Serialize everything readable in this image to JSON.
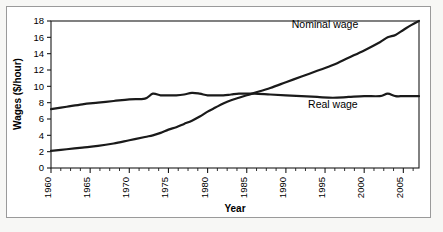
{
  "chart_data": {
    "type": "line",
    "title": "",
    "xlabel": "Year",
    "ylabel": "Wages ($/hour)",
    "xlim": [
      1960,
      2007
    ],
    "ylim": [
      0,
      18
    ],
    "ytick_step": 2,
    "xtick_step": 5,
    "minor_ticks": true,
    "grid": false,
    "legend_position": "inline-annotations",
    "ytick_labels": [
      "0",
      "2",
      "4",
      "6",
      "8",
      "10",
      "12",
      "14",
      "16",
      "18"
    ],
    "ytick_values": [
      0,
      2,
      4,
      6,
      8,
      10,
      12,
      14,
      16,
      18
    ],
    "xtick_labels": [
      "1960",
      "1965",
      "1970",
      "1975",
      "1980",
      "1985",
      "1990",
      "1995",
      "2000",
      "2005"
    ],
    "xtick_values": [
      1960,
      1965,
      1970,
      1975,
      1980,
      1985,
      1990,
      1995,
      2000,
      2005
    ],
    "x": [
      1960,
      1962,
      1964,
      1966,
      1968,
      1970,
      1972,
      1973,
      1974,
      1975,
      1976,
      1977,
      1978,
      1979,
      1980,
      1981,
      1982,
      1983,
      1984,
      1985,
      1986,
      1988,
      1990,
      1992,
      1994,
      1996,
      1998,
      2000,
      2002,
      2003,
      2004,
      2005,
      2006,
      2007
    ],
    "series": [
      {
        "name": "Nominal wage",
        "color": "#1a1a1a",
        "values": [
          2.1,
          2.3,
          2.5,
          2.7,
          3.0,
          3.4,
          3.8,
          4.0,
          4.3,
          4.7,
          5.0,
          5.4,
          5.8,
          6.3,
          6.9,
          7.4,
          7.9,
          8.3,
          8.6,
          8.9,
          9.2,
          9.8,
          10.5,
          11.2,
          11.9,
          12.6,
          13.5,
          14.4,
          15.4,
          16.0,
          16.3,
          16.9,
          17.5,
          18.0
        ]
      },
      {
        "name": "Real wage",
        "color": "#1a1a1a",
        "values": [
          7.2,
          7.5,
          7.8,
          8.0,
          8.2,
          8.4,
          8.5,
          9.1,
          8.9,
          8.9,
          8.9,
          9.0,
          9.2,
          9.1,
          8.9,
          8.9,
          8.9,
          9.0,
          9.1,
          9.1,
          9.1,
          9.0,
          8.9,
          8.8,
          8.7,
          8.6,
          8.7,
          8.8,
          8.8,
          9.1,
          8.8,
          8.8,
          8.8,
          8.8
        ]
      }
    ],
    "annotations": [
      {
        "text": "Nominal wage",
        "x": 1995.0,
        "y": 17.2
      },
      {
        "text": "Real wage",
        "x": 1996.0,
        "y": 7.4
      }
    ]
  }
}
